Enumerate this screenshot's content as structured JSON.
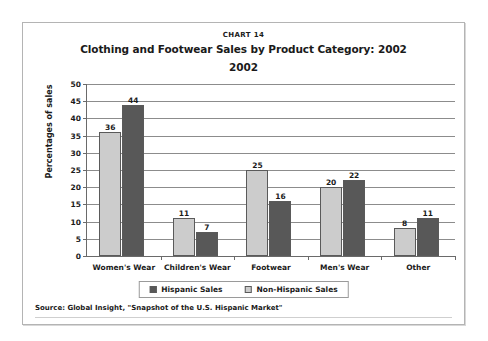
{
  "chart_number": "CHART 14",
  "title": "Clothing and Footwear Sales by Product Category:",
  "subtitle": "2002",
  "source": "Source: Global Insight, \"Snapshot of the U.S. Hispanic Market\"",
  "colors": {
    "hispanic": "#585858",
    "non_hispanic": "#cccccc",
    "gridline": "#8c8c8c",
    "axis": "#6a6a6a",
    "frame": "#b4b4b4"
  },
  "chart_data": {
    "type": "bar",
    "title": "Clothing and Footwear Sales by Product Category: 2002",
    "xlabel": "",
    "ylabel": "Percentages of sales",
    "ylim": [
      0,
      50
    ],
    "yticks": [
      0,
      5,
      10,
      15,
      20,
      25,
      30,
      35,
      40,
      45,
      50
    ],
    "grid": true,
    "legend_position": "bottom",
    "categories": [
      "Women's Wear",
      "Children's Wear",
      "Footwear",
      "Men's Wear",
      "Other"
    ],
    "series": [
      {
        "name": "Non-Hispanic Sales",
        "color": "#cccccc",
        "values": [
          36,
          11,
          25,
          20,
          8
        ]
      },
      {
        "name": "Hispanic Sales",
        "color": "#585858",
        "values": [
          44,
          7,
          16,
          22,
          11
        ]
      }
    ]
  },
  "legend": {
    "entries": [
      {
        "label": "Hispanic Sales",
        "swatch": "dark"
      },
      {
        "label": "Non-Hispanic Sales",
        "swatch": "light"
      }
    ]
  }
}
